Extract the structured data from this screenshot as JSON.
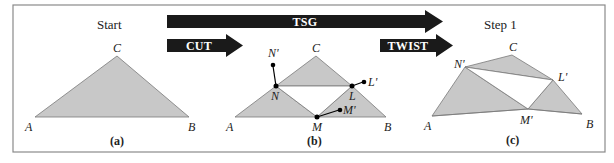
{
  "colors": {
    "frame": "#8a8a8a",
    "fill": "#c8c8c8",
    "edge": "#7a7a7a",
    "arrow": "#1a1a1a",
    "arrow_text": "#ffffff",
    "point": "#000000"
  },
  "headings": {
    "start": "Start",
    "step1": "Step 1"
  },
  "arrows": {
    "tsg": "TSG",
    "cut": "CUT",
    "twist": "TWIST"
  },
  "panels": {
    "a": {
      "caption": "(a)",
      "labels": {
        "A": "A",
        "B": "B",
        "C": "C"
      }
    },
    "b": {
      "caption": "(b)",
      "labels": {
        "A": "A",
        "B": "B",
        "C": "C",
        "N": "N",
        "L": "L",
        "M": "M",
        "N_prime": "N'",
        "L_prime": "L'",
        "M_prime": "M'"
      }
    },
    "c": {
      "caption": "(c)",
      "labels": {
        "A": "A",
        "B": "B",
        "C": "C",
        "N_prime": "N'",
        "L_prime": "L'",
        "M_prime": "M'"
      }
    }
  }
}
